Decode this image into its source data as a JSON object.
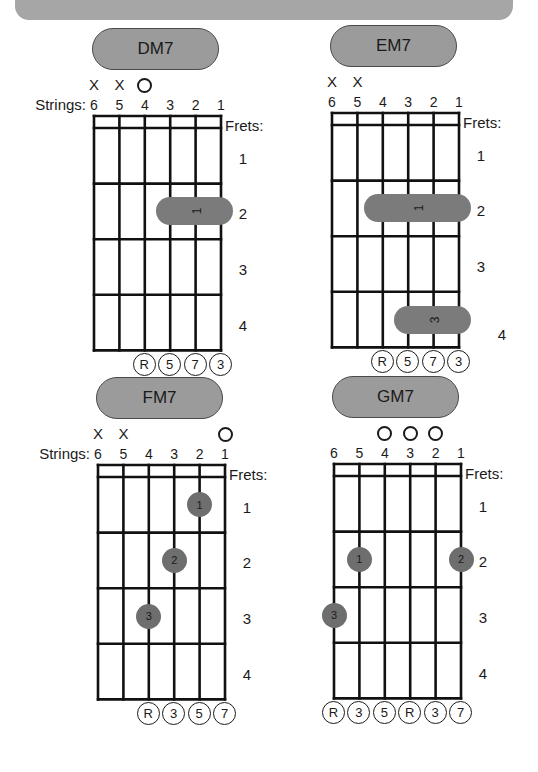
{
  "labels": {
    "strings": "Strings:",
    "frets": "Frets:"
  },
  "chords": [
    {
      "name": "DM7",
      "show_strings_label": true,
      "string_numbers": [
        "6",
        "5",
        "4",
        "3",
        "2",
        "1"
      ],
      "fret_numbers": [
        "1",
        "2",
        "3",
        "4"
      ],
      "markers": [
        {
          "string": 6,
          "type": "X",
          "symbol": "X"
        },
        {
          "string": 5,
          "type": "X",
          "symbol": "X"
        },
        {
          "string": 4,
          "type": "O",
          "symbol": "O"
        }
      ],
      "barres": [
        {
          "fret": 2,
          "from_string": 3,
          "to_string": 1,
          "finger": "1"
        }
      ],
      "dots": [],
      "intervals": [
        {
          "string": 4,
          "label": "R"
        },
        {
          "string": 3,
          "label": "5"
        },
        {
          "string": 2,
          "label": "7"
        },
        {
          "string": 1,
          "label": "3"
        }
      ]
    },
    {
      "name": "EM7",
      "show_strings_label": false,
      "string_numbers": [
        "6",
        "5",
        "4",
        "3",
        "2",
        "1"
      ],
      "fret_numbers": [
        "1",
        "2",
        "3",
        "4"
      ],
      "markers": [
        {
          "string": 6,
          "type": "X",
          "symbol": "X"
        },
        {
          "string": 5,
          "type": "X",
          "symbol": "X"
        }
      ],
      "barres": [
        {
          "fret": 2,
          "from_string": 4,
          "to_string": 1,
          "finger": "1"
        },
        {
          "fret": 4,
          "from_string": 3,
          "to_string": 1,
          "finger": "3"
        }
      ],
      "dots": [],
      "intervals": [
        {
          "string": 4,
          "label": "R"
        },
        {
          "string": 3,
          "label": "5"
        },
        {
          "string": 2,
          "label": "7"
        },
        {
          "string": 1,
          "label": "3"
        }
      ]
    },
    {
      "name": "FM7",
      "show_strings_label": true,
      "string_numbers": [
        "6",
        "5",
        "4",
        "3",
        "2",
        "1"
      ],
      "fret_numbers": [
        "1",
        "2",
        "3",
        "4"
      ],
      "markers": [
        {
          "string": 6,
          "type": "X",
          "symbol": "X"
        },
        {
          "string": 5,
          "type": "X",
          "symbol": "X"
        },
        {
          "string": 1,
          "type": "O",
          "symbol": "O"
        }
      ],
      "barres": [],
      "dots": [
        {
          "string": 2,
          "fret": 1,
          "finger": "1"
        },
        {
          "string": 3,
          "fret": 2,
          "finger": "2"
        },
        {
          "string": 4,
          "fret": 3,
          "finger": "3"
        }
      ],
      "intervals": [
        {
          "string": 4,
          "label": "R"
        },
        {
          "string": 3,
          "label": "3"
        },
        {
          "string": 2,
          "label": "5"
        },
        {
          "string": 1,
          "label": "7"
        }
      ]
    },
    {
      "name": "GM7",
      "show_strings_label": false,
      "string_numbers": [
        "6",
        "5",
        "4",
        "3",
        "2",
        "1"
      ],
      "fret_numbers": [
        "1",
        "2",
        "3",
        "4"
      ],
      "markers": [
        {
          "string": 4,
          "type": "O",
          "symbol": "O"
        },
        {
          "string": 3,
          "type": "O",
          "symbol": "O"
        },
        {
          "string": 2,
          "type": "O",
          "symbol": "O"
        }
      ],
      "barres": [],
      "dots": [
        {
          "string": 5,
          "fret": 2,
          "finger": "1"
        },
        {
          "string": 1,
          "fret": 2,
          "finger": "2"
        },
        {
          "string": 6,
          "fret": 3,
          "finger": "3"
        }
      ],
      "intervals": [
        {
          "string": 6,
          "label": "R"
        },
        {
          "string": 5,
          "label": "3"
        },
        {
          "string": 4,
          "label": "5"
        },
        {
          "string": 3,
          "label": "R"
        },
        {
          "string": 2,
          "label": "3"
        },
        {
          "string": 1,
          "label": "7"
        }
      ]
    }
  ]
}
